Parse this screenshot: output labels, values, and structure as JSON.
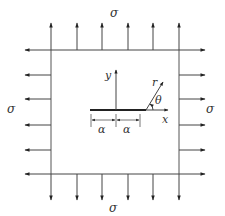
{
  "diagram": {
    "labels": {
      "sigma_top": "σ",
      "sigma_bottom": "σ",
      "sigma_left": "σ",
      "sigma_right": "σ",
      "y_axis": "y",
      "x_axis": "x",
      "r": "r",
      "theta": "θ",
      "half_crack_left": "α",
      "half_crack_right": "α"
    },
    "colors": {
      "line": "#444444",
      "arrow": "#222222",
      "background": "#ffffff"
    }
  }
}
